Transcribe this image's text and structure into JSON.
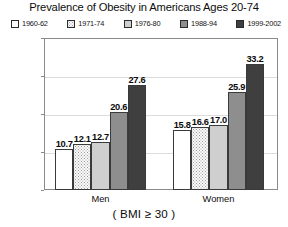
{
  "chart_data": {
    "type": "bar",
    "title": "Prevalence of Obesity in Americans Ages 20-74",
    "xlabel": "( BMI ≥ 30 )",
    "ylabel": "Percent of Population",
    "categories": [
      "Men",
      "Women"
    ],
    "ylim": [
      0,
      40
    ],
    "yticks": [
      0,
      10,
      20,
      30,
      40
    ],
    "ytick_labels": [
      "0",
      "10",
      "20",
      "30",
      "40"
    ],
    "grid": "horizontal",
    "gridlines_at": [
      10,
      20,
      30
    ],
    "legend_position": "top",
    "series": [
      {
        "name": "1960-62",
        "color": "#ffffff",
        "pattern": "solid",
        "values": [
          10.7,
          15.8
        ],
        "labels": [
          "10.7",
          "15.8"
        ]
      },
      {
        "name": "1971-74",
        "color": "#fbfbfb",
        "pattern": "dotted",
        "values": [
          12.1,
          16.6
        ],
        "labels": [
          "12.1",
          "16.6"
        ]
      },
      {
        "name": "1976-80",
        "color": "#cfcfcf",
        "pattern": "solid",
        "values": [
          12.7,
          17.0
        ],
        "labels": [
          "12.7",
          "17.0"
        ]
      },
      {
        "name": "1988-94",
        "color": "#8e8e8e",
        "pattern": "solid",
        "values": [
          20.6,
          25.9
        ],
        "labels": [
          "20.6",
          "25.9"
        ]
      },
      {
        "name": "1999-2002",
        "color": "#3f3f3f",
        "pattern": "solid",
        "values": [
          27.6,
          33.2
        ],
        "labels": [
          "27.6",
          "33.2"
        ]
      }
    ]
  },
  "legend": {
    "items": [
      {
        "label": "1960-62"
      },
      {
        "label": "1971-74"
      },
      {
        "label": "1976-80"
      },
      {
        "label": "1988-94"
      },
      {
        "label": "1999-2002"
      }
    ]
  },
  "axes": {
    "y_title": "Percent of Population",
    "y_ticks": [
      {
        "label": "40"
      },
      {
        "label": "30"
      },
      {
        "label": "20"
      },
      {
        "label": "10"
      },
      {
        "label": "0"
      }
    ],
    "x_groups": [
      {
        "label": "Men"
      },
      {
        "label": "Women"
      }
    ],
    "caption": "( BMI ≥ 30 )"
  },
  "title": "Prevalence of Obesity in Americans Ages 20-74"
}
